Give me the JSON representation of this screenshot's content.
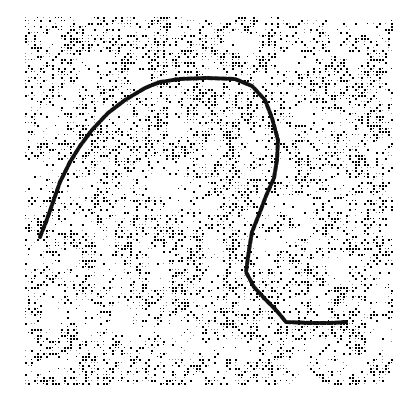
{
  "image": {
    "description": "Dithered noise stipple texture square with a dark hand-traced contour curve",
    "background_color": "#ffffff",
    "ink_color": "#000000",
    "gray_color": "#8c8c8c",
    "texture_region": {
      "x": 25,
      "y": 17,
      "width": 369,
      "height": 371
    },
    "cell_size": 3,
    "density": 0.42
  },
  "curve": {
    "color": "#111111",
    "stroke_width": 4,
    "points": [
      [
        40,
        237
      ],
      [
        46,
        222
      ],
      [
        52,
        205
      ],
      [
        60,
        182
      ],
      [
        70,
        162
      ],
      [
        80,
        146
      ],
      [
        92,
        130
      ],
      [
        108,
        113
      ],
      [
        125,
        100
      ],
      [
        145,
        88
      ],
      [
        160,
        82
      ],
      [
        180,
        79
      ],
      [
        205,
        78
      ],
      [
        235,
        79
      ],
      [
        252,
        86
      ],
      [
        265,
        100
      ],
      [
        272,
        118
      ],
      [
        278,
        140
      ],
      [
        277,
        160
      ],
      [
        274,
        178
      ],
      [
        266,
        196
      ],
      [
        260,
        212
      ],
      [
        252,
        232
      ],
      [
        249,
        250
      ],
      [
        246,
        272
      ],
      [
        254,
        287
      ],
      [
        264,
        298
      ],
      [
        276,
        310
      ],
      [
        286,
        322
      ],
      [
        310,
        323
      ],
      [
        330,
        323
      ],
      [
        346,
        322
      ]
    ]
  }
}
